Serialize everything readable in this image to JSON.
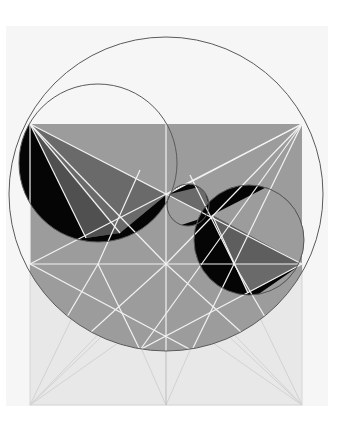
{
  "diagram": {
    "title": "Geometric construction: circle, square and inscribed circles",
    "colors": {
      "background": "#ffffff",
      "paper": "#f3f3f3",
      "lower_square": "#e6e6e6",
      "gray_fill": "#9a9a9a",
      "dark_gray": "#5e5e5e",
      "mid_gray": "#777777",
      "black": "#050505",
      "white_lines": "#f4f4f4",
      "circle_stroke": "#555555",
      "faint_lines": "#d4d4d4"
    },
    "shapes": {
      "big_circle": {
        "cx": 166,
        "cy": 194,
        "r": 157
      },
      "upper_left_circle": {
        "cx": 98,
        "cy": 163,
        "r": 79
      },
      "small_center_circle": {
        "cx": 188,
        "cy": 205,
        "r": 21
      },
      "lower_right_circle": {
        "cx": 249,
        "cy": 240,
        "r": 55
      },
      "upper_rect": {
        "x": 30,
        "y": 124,
        "w": 272,
        "h": 140
      },
      "lower_square": {
        "x": 30,
        "y": 264,
        "w": 272,
        "h": 141
      }
    }
  }
}
